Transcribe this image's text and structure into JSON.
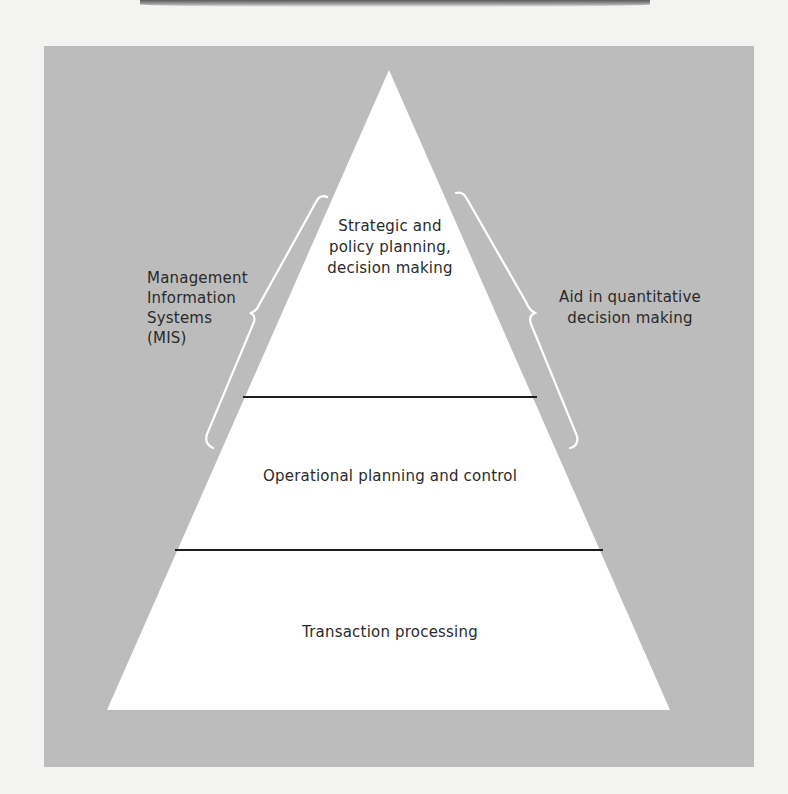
{
  "diagram": {
    "type": "pyramid",
    "levels": [
      {
        "position": "top",
        "label_lines": [
          "Strategic and",
          "policy planning,",
          "decision making"
        ]
      },
      {
        "position": "middle",
        "label": "Operational planning and control"
      },
      {
        "position": "bottom",
        "label": "Transaction processing"
      }
    ],
    "left_brace": {
      "spans": [
        "top",
        "middle"
      ],
      "label_lines": [
        "Management",
        "Information",
        "Systems",
        "(MIS)"
      ]
    },
    "right_brace": {
      "spans": [
        "top",
        "middle"
      ],
      "label_lines": [
        "Aid in quantitative",
        "decision making"
      ]
    },
    "colors": {
      "panel": "#bcbcbc",
      "pyramid_fill": "#ffffff",
      "divider": "#1e1e1e",
      "brace": "#ffffff",
      "text": "#2a2a2a"
    }
  }
}
